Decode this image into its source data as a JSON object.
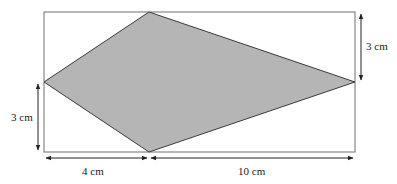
{
  "diagram": {
    "shape": "kite",
    "colors": {
      "kite_fill": "#b5b5b5",
      "kite_stroke": "#3a3a3a",
      "rectangle_stroke": "#6e6e6e",
      "arrow": "#222222",
      "text": "#222222"
    },
    "dimensions": {
      "left_height": {
        "label": "3 cm",
        "value": 3,
        "unit": "cm"
      },
      "right_height": {
        "label": "3 cm",
        "value": 3,
        "unit": "cm"
      },
      "bottom_left_width": {
        "label": "4 cm",
        "value": 4,
        "unit": "cm"
      },
      "bottom_right_width": {
        "label": "10 cm",
        "value": 10,
        "unit": "cm"
      }
    }
  }
}
